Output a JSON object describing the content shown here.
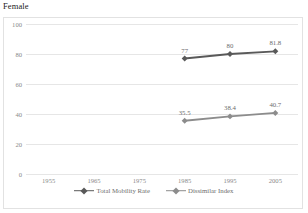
{
  "chart_data": {
    "type": "line",
    "title": "Female",
    "xlabel": "",
    "ylabel": "",
    "x": [
      1955,
      1965,
      1975,
      1985,
      1995,
      2005
    ],
    "xtick_labels": [
      "1955",
      "1965",
      "1975",
      "1985",
      "1995",
      "2005"
    ],
    "ylim": [
      0,
      100
    ],
    "yticks": [
      0,
      20,
      40,
      60,
      80,
      100
    ],
    "ytick_labels": [
      "0",
      "20",
      "40",
      "60",
      "80",
      "100"
    ],
    "grid": true,
    "legend_position": "bottom",
    "series": [
      {
        "name": "Total Mobility Rate",
        "color": "#595959",
        "x": [
          1985,
          1995,
          2005
        ],
        "values": [
          77,
          80,
          81.8
        ],
        "data_labels": [
          "77",
          "80",
          "81.8"
        ]
      },
      {
        "name": "Dissimilar Index",
        "color": "#8c8c8c",
        "x": [
          1985,
          1995,
          2005
        ],
        "values": [
          35.5,
          38.4,
          40.7
        ],
        "data_labels": [
          "35.5",
          "38.4",
          "40.7"
        ]
      }
    ]
  }
}
